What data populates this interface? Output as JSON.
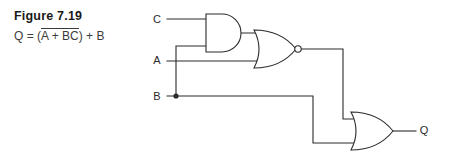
{
  "figure": {
    "title": "Figure 7.19",
    "equation_prefix": "Q = (",
    "equation_barred": "A + BC",
    "equation_suffix": ") + B",
    "equation_plain": "Q = (A + BC) + B"
  },
  "circuit": {
    "inputs": [
      {
        "name": "input-c",
        "label": "C"
      },
      {
        "name": "input-a",
        "label": "A"
      },
      {
        "name": "input-b",
        "label": "B"
      }
    ],
    "outputs": [
      {
        "name": "output-q",
        "label": "Q"
      }
    ],
    "gates": [
      {
        "name": "and-gate",
        "type": "AND",
        "inverted": false
      },
      {
        "name": "nor-gate",
        "type": "NOR",
        "inverted": true
      },
      {
        "name": "or-gate",
        "type": "OR",
        "inverted": false
      }
    ]
  },
  "colors": {
    "ink": "#2b2b2b",
    "title": "#1a1a1a",
    "equation": "#3b3b3b",
    "background": "#ffffff"
  }
}
